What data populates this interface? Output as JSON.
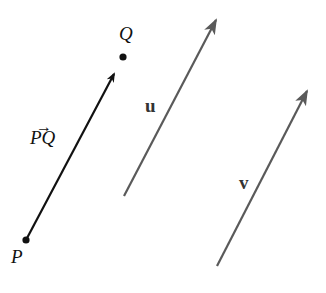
{
  "diagram": {
    "points": [
      {
        "name": "P",
        "x": 26,
        "y": 240
      },
      {
        "name": "Q",
        "x": 123,
        "y": 57
      }
    ],
    "vectors": [
      {
        "label": "PQ",
        "from": [
          26,
          240
        ],
        "to": [
          118,
          67
        ],
        "color": "#111111",
        "style": "arrow-to-point"
      },
      {
        "label": "u",
        "from": [
          124,
          196
        ],
        "to": [
          216,
          20
        ],
        "color": "#5a5a5a"
      },
      {
        "label": "v",
        "from": [
          217,
          266
        ],
        "to": [
          307,
          91
        ],
        "color": "#5a5a5a"
      }
    ],
    "labels": {
      "P": "P",
      "Q": "Q",
      "PQ": "PQ",
      "PQ_arrow": "→",
      "u": "u",
      "v": "v"
    }
  }
}
